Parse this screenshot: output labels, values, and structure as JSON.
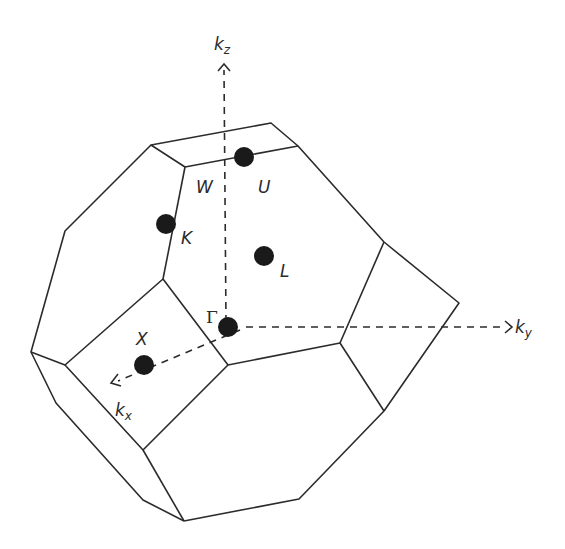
{
  "diagram": {
    "type": "brillouin-zone",
    "line_color": "#2b2b2b",
    "point_color": "#1a1a1a",
    "axes": [
      {
        "id": "kz",
        "label": "k",
        "subscript": "z",
        "direction": "up"
      },
      {
        "id": "ky",
        "label": "k",
        "subscript": "y",
        "direction": "right"
      },
      {
        "id": "kx",
        "label": "k",
        "subscript": "x",
        "direction": "down-left"
      }
    ],
    "points": [
      {
        "id": "Gamma",
        "label": "Γ",
        "x": 246,
        "y": 326
      },
      {
        "id": "X",
        "label": "X",
        "x": 156,
        "y": 368
      },
      {
        "id": "K",
        "label": "K",
        "x": 178,
        "y": 224
      },
      {
        "id": "L",
        "label": "L",
        "x": 285,
        "y": 256
      },
      {
        "id": "U",
        "label": "U",
        "x": 262,
        "y": 157
      },
      {
        "id": "W",
        "label": "W",
        "x": null,
        "y": null
      }
    ]
  }
}
